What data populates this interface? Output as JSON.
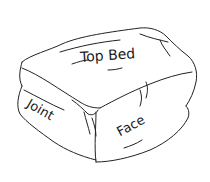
{
  "diagram": {
    "labels": {
      "top": "Top Bed",
      "side": "Joint",
      "front": "Face"
    }
  }
}
